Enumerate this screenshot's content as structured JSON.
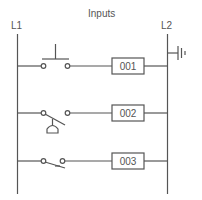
{
  "title": "Inputs",
  "rails": {
    "left": "L1",
    "right": "L2"
  },
  "rungs": [
    {
      "contact": "pushbutton-normally-open",
      "output": "001"
    },
    {
      "contact": "foot-switch",
      "output": "002"
    },
    {
      "contact": "limit-switch",
      "output": "003"
    }
  ],
  "colors": {
    "line": "#555555"
  }
}
